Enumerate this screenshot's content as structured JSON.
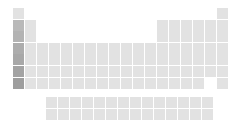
{
  "figure": {
    "name": "periodic-table-grid",
    "kind": "periodic-table",
    "background_color": "#ffffff",
    "cell_color": "#e2e2e2",
    "highlight_column_color": "#b9b9b9",
    "width_px": 229,
    "height_px": 125
  },
  "layout": {
    "origin_x": 13,
    "origin_y": 8,
    "cell_width": 11,
    "cell_height": 11,
    "col_pitch": 12,
    "row_pitch": 11.6,
    "fblock_origin_x": 46,
    "fblock_origin_y": 97,
    "fblock_row_pitch": 12,
    "columns": 18,
    "main_rows": 7,
    "fblock_rows": 2,
    "fblock_columns": 14
  },
  "groups": {
    "highlighted_group": 1,
    "highlight_rows": [
      2,
      3,
      4,
      5,
      6,
      7
    ]
  },
  "main_block": [
    {
      "row": 1,
      "cells": [
        {
          "group": 1,
          "symbol": "H",
          "highlight": false
        },
        {
          "group": 18,
          "symbol": "He",
          "highlight": false
        }
      ]
    },
    {
      "row": 2,
      "cells": [
        {
          "group": 1,
          "symbol": "Li",
          "highlight": true
        },
        {
          "group": 2,
          "symbol": "Be",
          "highlight": false
        },
        {
          "group": 13,
          "symbol": "B",
          "highlight": false
        },
        {
          "group": 14,
          "symbol": "C",
          "highlight": false
        },
        {
          "group": 15,
          "symbol": "N",
          "highlight": false
        },
        {
          "group": 16,
          "symbol": "O",
          "highlight": false
        },
        {
          "group": 17,
          "symbol": "F",
          "highlight": false
        },
        {
          "group": 18,
          "symbol": "Ne",
          "highlight": false
        }
      ]
    },
    {
      "row": 3,
      "cells": [
        {
          "group": 1,
          "symbol": "Na",
          "highlight": true
        },
        {
          "group": 2,
          "symbol": "Mg",
          "highlight": false
        },
        {
          "group": 13,
          "symbol": "Al",
          "highlight": false
        },
        {
          "group": 14,
          "symbol": "Si",
          "highlight": false
        },
        {
          "group": 15,
          "symbol": "P",
          "highlight": false
        },
        {
          "group": 16,
          "symbol": "S",
          "highlight": false
        },
        {
          "group": 17,
          "symbol": "Cl",
          "highlight": false
        },
        {
          "group": 18,
          "symbol": "Ar",
          "highlight": false
        }
      ]
    },
    {
      "row": 4,
      "cells": [
        {
          "group": 1,
          "symbol": "K",
          "highlight": true
        },
        {
          "group": 2,
          "symbol": "Ca",
          "highlight": false
        },
        {
          "group": 3,
          "symbol": "Sc",
          "highlight": false
        },
        {
          "group": 4,
          "symbol": "Ti",
          "highlight": false
        },
        {
          "group": 5,
          "symbol": "V",
          "highlight": false
        },
        {
          "group": 6,
          "symbol": "Cr",
          "highlight": false
        },
        {
          "group": 7,
          "symbol": "Mn",
          "highlight": false
        },
        {
          "group": 8,
          "symbol": "Fe",
          "highlight": false
        },
        {
          "group": 9,
          "symbol": "Co",
          "highlight": false
        },
        {
          "group": 10,
          "symbol": "Ni",
          "highlight": false
        },
        {
          "group": 11,
          "symbol": "Cu",
          "highlight": false
        },
        {
          "group": 12,
          "symbol": "Zn",
          "highlight": false
        },
        {
          "group": 13,
          "symbol": "Ga",
          "highlight": false
        },
        {
          "group": 14,
          "symbol": "Ge",
          "highlight": false
        },
        {
          "group": 15,
          "symbol": "As",
          "highlight": false
        },
        {
          "group": 16,
          "symbol": "Se",
          "highlight": false
        },
        {
          "group": 17,
          "symbol": "Br",
          "highlight": false
        },
        {
          "group": 18,
          "symbol": "Kr",
          "highlight": false
        }
      ]
    },
    {
      "row": 5,
      "cells": [
        {
          "group": 1,
          "symbol": "Rb",
          "highlight": true
        },
        {
          "group": 2,
          "symbol": "Sr",
          "highlight": false
        },
        {
          "group": 3,
          "symbol": "Y",
          "highlight": false
        },
        {
          "group": 4,
          "symbol": "Zr",
          "highlight": false
        },
        {
          "group": 5,
          "symbol": "Nb",
          "highlight": false
        },
        {
          "group": 6,
          "symbol": "Mo",
          "highlight": false
        },
        {
          "group": 7,
          "symbol": "Tc",
          "highlight": false
        },
        {
          "group": 8,
          "symbol": "Ru",
          "highlight": false
        },
        {
          "group": 9,
          "symbol": "Rh",
          "highlight": false
        },
        {
          "group": 10,
          "symbol": "Pd",
          "highlight": false
        },
        {
          "group": 11,
          "symbol": "Ag",
          "highlight": false
        },
        {
          "group": 12,
          "symbol": "Cd",
          "highlight": false
        },
        {
          "group": 13,
          "symbol": "In",
          "highlight": false
        },
        {
          "group": 14,
          "symbol": "Sn",
          "highlight": false
        },
        {
          "group": 15,
          "symbol": "Sb",
          "highlight": false
        },
        {
          "group": 16,
          "symbol": "Te",
          "highlight": false
        },
        {
          "group": 17,
          "symbol": "I",
          "highlight": false
        },
        {
          "group": 18,
          "symbol": "Xe",
          "highlight": false
        }
      ]
    },
    {
      "row": 6,
      "cells": [
        {
          "group": 1,
          "symbol": "Cs",
          "highlight": true
        },
        {
          "group": 2,
          "symbol": "Ba",
          "highlight": false
        },
        {
          "group": 3,
          "symbol": "La",
          "highlight": false
        },
        {
          "group": 4,
          "symbol": "Hf",
          "highlight": false
        },
        {
          "group": 5,
          "symbol": "Ta",
          "highlight": false
        },
        {
          "group": 6,
          "symbol": "W",
          "highlight": false
        },
        {
          "group": 7,
          "symbol": "Re",
          "highlight": false
        },
        {
          "group": 8,
          "symbol": "Os",
          "highlight": false
        },
        {
          "group": 9,
          "symbol": "Ir",
          "highlight": false
        },
        {
          "group": 10,
          "symbol": "Pt",
          "highlight": false
        },
        {
          "group": 11,
          "symbol": "Au",
          "highlight": false
        },
        {
          "group": 12,
          "symbol": "Hg",
          "highlight": false
        },
        {
          "group": 13,
          "symbol": "Tl",
          "highlight": false
        },
        {
          "group": 14,
          "symbol": "Pb",
          "highlight": false
        },
        {
          "group": 15,
          "symbol": "Bi",
          "highlight": false
        },
        {
          "group": 16,
          "symbol": "Po",
          "highlight": false
        },
        {
          "group": 17,
          "symbol": "At",
          "highlight": false
        },
        {
          "group": 18,
          "symbol": "Rn",
          "highlight": false
        }
      ]
    },
    {
      "row": 7,
      "cells": [
        {
          "group": 1,
          "symbol": "Fr",
          "highlight": true
        },
        {
          "group": 2,
          "symbol": "Ra",
          "highlight": false
        },
        {
          "group": 3,
          "symbol": "Ac",
          "highlight": false
        },
        {
          "group": 4,
          "symbol": "Rf",
          "highlight": false
        },
        {
          "group": 5,
          "symbol": "Db",
          "highlight": false
        },
        {
          "group": 6,
          "symbol": "Sg",
          "highlight": false
        },
        {
          "group": 7,
          "symbol": "Bh",
          "highlight": false
        },
        {
          "group": 8,
          "symbol": "Hs",
          "highlight": false
        },
        {
          "group": 9,
          "symbol": "Mt",
          "highlight": false
        },
        {
          "group": 10,
          "symbol": "Ds",
          "highlight": false
        },
        {
          "group": 11,
          "symbol": "Rg",
          "highlight": false
        },
        {
          "group": 12,
          "symbol": "Cn",
          "highlight": false
        },
        {
          "group": 13,
          "symbol": "Nh",
          "highlight": false
        },
        {
          "group": 14,
          "symbol": "Fl",
          "highlight": false
        },
        {
          "group": 15,
          "symbol": "Mc",
          "highlight": false
        },
        {
          "group": 16,
          "symbol": "Lv",
          "highlight": false
        },
        {
          "group": 18,
          "symbol": "Og",
          "highlight": false
        }
      ]
    }
  ],
  "f_block": [
    {
      "row": 1,
      "cells": [
        {
          "col": 1,
          "symbol": "Ce"
        },
        {
          "col": 2,
          "symbol": "Pr"
        },
        {
          "col": 3,
          "symbol": "Nd"
        },
        {
          "col": 4,
          "symbol": "Pm"
        },
        {
          "col": 5,
          "symbol": "Sm"
        },
        {
          "col": 6,
          "symbol": "Eu"
        },
        {
          "col": 7,
          "symbol": "Gd"
        },
        {
          "col": 8,
          "symbol": "Tb"
        },
        {
          "col": 9,
          "symbol": "Dy"
        },
        {
          "col": 10,
          "symbol": "Ho"
        },
        {
          "col": 11,
          "symbol": "Er"
        },
        {
          "col": 12,
          "symbol": "Tm"
        },
        {
          "col": 13,
          "symbol": "Yb"
        },
        {
          "col": 14,
          "symbol": "Lu"
        }
      ]
    },
    {
      "row": 2,
      "cells": [
        {
          "col": 1,
          "symbol": "Th"
        },
        {
          "col": 2,
          "symbol": "Pa"
        },
        {
          "col": 3,
          "symbol": "U"
        },
        {
          "col": 4,
          "symbol": "Np"
        },
        {
          "col": 5,
          "symbol": "Pu"
        },
        {
          "col": 6,
          "symbol": "Am"
        },
        {
          "col": 7,
          "symbol": "Cm"
        },
        {
          "col": 8,
          "symbol": "Bk"
        },
        {
          "col": 9,
          "symbol": "Cf"
        },
        {
          "col": 10,
          "symbol": "Es"
        },
        {
          "col": 11,
          "symbol": "Fm"
        },
        {
          "col": 12,
          "symbol": "Md"
        },
        {
          "col": 13,
          "symbol": "No"
        },
        {
          "col": 14,
          "symbol": "Lr"
        }
      ]
    }
  ]
}
